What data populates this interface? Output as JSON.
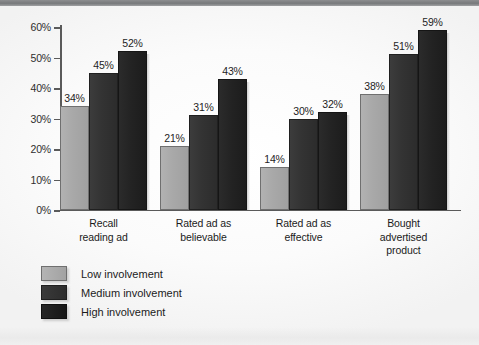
{
  "figure": {
    "background_color": "#fdfdfd",
    "top_band_color": "#7c7e80"
  },
  "chart_data": {
    "type": "bar",
    "title": "",
    "subtitle": "",
    "xlabel": "",
    "ylabel": "",
    "ylim": [
      0,
      60
    ],
    "ytick_labels": [
      "0%",
      "10%",
      "20%",
      "30%",
      "40%",
      "50%",
      "60%"
    ],
    "ytick_values": [
      0,
      10,
      20,
      30,
      40,
      50,
      60
    ],
    "grid": false,
    "legend_position": "below-left",
    "value_suffix": "%",
    "categories": [
      "Recall\nreading ad",
      "Rated ad as\nbelievable",
      "Rated ad as\neffective",
      "Bought\nadvertised\nproduct"
    ],
    "category_lines": [
      [
        "Recall",
        "reading ad"
      ],
      [
        "Rated ad as",
        "believable"
      ],
      [
        "Rated ad as",
        "effective"
      ],
      [
        "Bought",
        "advertised",
        "product"
      ]
    ],
    "series": [
      {
        "name": "Low involvement",
        "color": "#a9a9a9",
        "values": [
          34,
          21,
          14,
          38
        ],
        "labels": [
          "34%",
          "21%",
          "14%",
          "38%"
        ]
      },
      {
        "name": "Medium involvement",
        "color": "#333333",
        "values": [
          45,
          31,
          30,
          51
        ],
        "labels": [
          "45%",
          "31%",
          "30%",
          "51%"
        ]
      },
      {
        "name": "High involvement",
        "color": "#222222",
        "values": [
          52,
          43,
          32,
          59
        ],
        "labels": [
          "52%",
          "43%",
          "32%",
          "59%"
        ]
      }
    ]
  },
  "legend": {
    "items": [
      {
        "label": "Low involvement",
        "color": "#a9a9a9"
      },
      {
        "label": "Medium involvement",
        "color": "#333333"
      },
      {
        "label": "High involvement",
        "color": "#222222"
      }
    ]
  }
}
